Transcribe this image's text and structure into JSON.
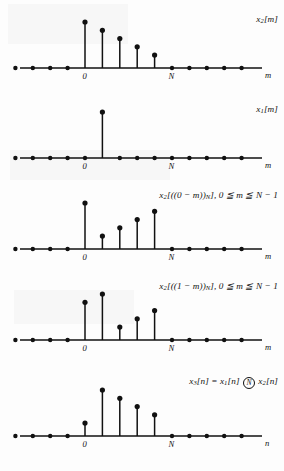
{
  "figure": {
    "background_color": "#fdfdfd",
    "ink_color": "#111111",
    "axis_origin_label": "0",
    "axis_period_label": "N",
    "panel_count": 5
  },
  "panels": [
    {
      "id": "panel-x2-m",
      "label_html": "x<sub>2</sub>[m]",
      "label_plain": "x2[m]",
      "axis_var": "m",
      "origin_label": "0",
      "period_label": "N",
      "stems": [
        {
          "n": 0,
          "value": 1.0
        },
        {
          "n": 1,
          "value": 0.82
        },
        {
          "n": 2,
          "value": 0.64
        },
        {
          "n": 3,
          "value": 0.46
        },
        {
          "n": 4,
          "value": 0.28
        }
      ],
      "zero_samples": [
        -4,
        -3,
        -2,
        -1,
        5,
        6,
        7,
        8,
        9
      ]
    },
    {
      "id": "panel-x1-m",
      "label_html": "x<sub>1</sub>[m]",
      "label_plain": "x1[m]",
      "axis_var": "m",
      "origin_label": "0",
      "period_label": "N",
      "stems": [
        {
          "n": 1,
          "value": 1.0
        }
      ],
      "zero_samples": [
        -4,
        -3,
        -2,
        -1,
        0,
        2,
        3,
        4,
        5,
        6,
        7,
        8,
        9
      ]
    },
    {
      "id": "panel-x2-reverse-0",
      "label_html": "x<sub>2</sub>[((0 &minus; m))<sub>N</sub>], 0 &#8806; m &#8806; N &minus; 1",
      "label_plain": "x2[((0 - m))N], 0 <= m <= N - 1",
      "axis_var": "m",
      "origin_label": "0",
      "period_label": "N",
      "stems": [
        {
          "n": 0,
          "value": 1.0
        },
        {
          "n": 1,
          "value": 0.28
        },
        {
          "n": 2,
          "value": 0.46
        },
        {
          "n": 3,
          "value": 0.64
        },
        {
          "n": 4,
          "value": 0.82
        }
      ],
      "zero_samples": [
        -4,
        -3,
        -2,
        -1,
        5,
        6,
        7,
        8,
        9
      ]
    },
    {
      "id": "panel-x2-reverse-1",
      "label_html": "x<sub>2</sub>[((1 &minus; m))<sub>N</sub>], 0 &#8806; m &#8806; N &minus; 1",
      "label_plain": "x2[((1 - m))N], 0 <= m <= N - 1",
      "axis_var": "m",
      "origin_label": "0",
      "period_label": "N",
      "stems": [
        {
          "n": 0,
          "value": 0.82
        },
        {
          "n": 1,
          "value": 1.0
        },
        {
          "n": 2,
          "value": 0.28
        },
        {
          "n": 3,
          "value": 0.46
        },
        {
          "n": 4,
          "value": 0.64
        }
      ],
      "zero_samples": [
        -4,
        -3,
        -2,
        -1,
        5,
        6,
        7,
        8,
        9
      ]
    },
    {
      "id": "panel-x3-n",
      "label_html": "x<sub>3</sub>[n] = x<sub>1</sub>[n] <span class=\"circN\">N</span> x<sub>2</sub>[n]",
      "label_plain": "x3[n] = x1[n] (N) x2[n]",
      "axis_var": "n",
      "origin_label": "0",
      "period_label": "N",
      "stems": [
        {
          "n": 0,
          "value": 0.28
        },
        {
          "n": 1,
          "value": 1.0
        },
        {
          "n": 2,
          "value": 0.82
        },
        {
          "n": 3,
          "value": 0.64
        },
        {
          "n": 4,
          "value": 0.46
        }
      ],
      "zero_samples": [
        -4,
        -3,
        -2,
        -1,
        5,
        6,
        7,
        8,
        9
      ]
    }
  ],
  "chart_data": {
    "type": "line",
    "xlabel": "m / n",
    "ylabel": "amplitude",
    "x": [
      -4,
      -3,
      -2,
      -1,
      0,
      1,
      2,
      3,
      4,
      5,
      6,
      7,
      8,
      9
    ],
    "series": [
      {
        "name": "x2[m]",
        "values": [
          0,
          0,
          0,
          0,
          1.0,
          0.82,
          0.64,
          0.46,
          0.28,
          0,
          0,
          0,
          0,
          0
        ]
      },
      {
        "name": "x1[m]",
        "values": [
          0,
          0,
          0,
          0,
          0,
          1.0,
          0,
          0,
          0,
          0,
          0,
          0,
          0,
          0
        ]
      },
      {
        "name": "x2[((0-m))N], 0<=m<=N-1",
        "values": [
          0,
          0,
          0,
          0,
          1.0,
          0.28,
          0.46,
          0.64,
          0.82,
          0,
          0,
          0,
          0,
          0
        ]
      },
      {
        "name": "x2[((1-m))N], 0<=m<=N-1",
        "values": [
          0,
          0,
          0,
          0,
          0.82,
          1.0,
          0.28,
          0.46,
          0.64,
          0,
          0,
          0,
          0,
          0
        ]
      },
      {
        "name": "x3[n] = x1[n] (N) x2[n]",
        "values": [
          0,
          0,
          0,
          0,
          0.28,
          1.0,
          0.82,
          0.64,
          0.46,
          0,
          0,
          0,
          0,
          0
        ]
      }
    ],
    "xlim": [
      -4,
      9
    ],
    "ylim": [
      0,
      1.05
    ],
    "grid": false,
    "legend": "right"
  }
}
